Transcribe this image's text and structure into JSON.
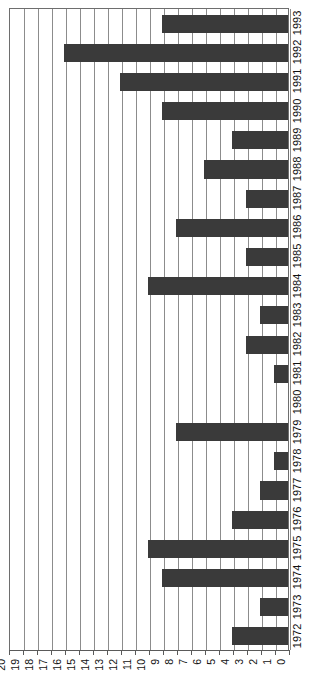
{
  "chart_data": {
    "type": "bar",
    "orientation": "horizontal",
    "title": "",
    "subtitle": "",
    "xlabel": "",
    "ylabel": "",
    "xlim": [
      20,
      0
    ],
    "x_reversed": true,
    "grid": true,
    "legend": false,
    "legend_position": "none",
    "bar_color": "#3a3a3a",
    "grid_color": "#8c8c8c",
    "axis_color": "#5a5a5a",
    "background_color": "#ffffff",
    "x_ticks": [
      20,
      19,
      18,
      17,
      16,
      15,
      14,
      13,
      12,
      11,
      10,
      9,
      8,
      7,
      6,
      5,
      4,
      3,
      2,
      1,
      0
    ],
    "x_tick_labels": [
      "20",
      "19",
      "18",
      "17",
      "16",
      "15",
      "14",
      "13",
      "12",
      "11",
      "10",
      "9",
      "8",
      "7",
      "6",
      "5",
      "4",
      "3",
      "2",
      "1",
      "0"
    ],
    "categories": [
      "1972",
      "1973",
      "1974",
      "1975",
      "1976",
      "1977",
      "1978",
      "1979",
      "1980",
      "1981",
      "1982",
      "1983",
      "1984",
      "1985",
      "1986",
      "1987",
      "1988",
      "1989",
      "1990",
      "1991",
      "1992",
      "1993"
    ],
    "values": [
      4,
      2,
      9,
      10,
      4,
      2,
      1,
      8,
      0,
      1,
      3,
      2,
      10,
      3,
      8,
      3,
      6,
      4,
      9,
      12,
      16,
      9
    ],
    "category_order_top_to_bottom": [
      "1993",
      "1992",
      "1991",
      "1990",
      "1989",
      "1988",
      "1987",
      "1986",
      "1985",
      "1984",
      "1983",
      "1982",
      "1981",
      "1980",
      "1979",
      "1978",
      "1977",
      "1976",
      "1975",
      "1974",
      "1973",
      "1972"
    ],
    "values_top_to_bottom": [
      9,
      16,
      12,
      9,
      4,
      6,
      3,
      8,
      3,
      10,
      2,
      3,
      1,
      0,
      8,
      1,
      2,
      4,
      10,
      9,
      2,
      4
    ],
    "annotations": []
  }
}
